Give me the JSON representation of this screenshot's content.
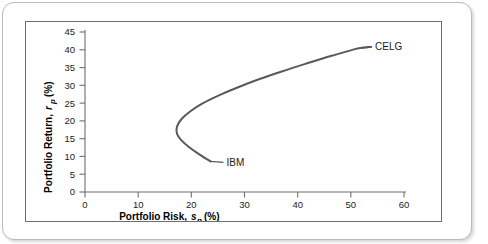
{
  "figure": {
    "background_color": "#ffffff",
    "border_color": "#b9babc",
    "plot_frame_color": "#6d6e70"
  },
  "chart_data": {
    "type": "line",
    "title": "",
    "subtitle": "",
    "xlabel": "Portfolio Risk, s_p (%)",
    "ylabel": "Portfolio Return, r_p (%)",
    "xlabel_parts": {
      "main": "Portfolio Risk,",
      "italic_symbol": "s",
      "subscript": "p",
      "unit": "(%)"
    },
    "ylabel_parts": {
      "main": "Portfolio Return,",
      "italic_symbol": "r",
      "subscript": "p",
      "unit": "(%)"
    },
    "xlim": [
      0,
      60
    ],
    "ylim": [
      0,
      45
    ],
    "xticks": [
      0,
      10,
      20,
      30,
      40,
      50,
      60
    ],
    "yticks": [
      0,
      5,
      10,
      15,
      20,
      25,
      30,
      35,
      40,
      45
    ],
    "grid": false,
    "legend": "none",
    "line_color": "#58595b",
    "series": [
      {
        "name": "efficient-frontier",
        "description": "Two-asset portfolio opportunity set between IBM and CELG",
        "points": [
          {
            "x": 23.6,
            "y": 8.6
          },
          {
            "x": 21.5,
            "y": 10.6
          },
          {
            "x": 19.6,
            "y": 12.6
          },
          {
            "x": 18.1,
            "y": 14.6
          },
          {
            "x": 17.3,
            "y": 16.4
          },
          {
            "x": 17.3,
            "y": 18.4
          },
          {
            "x": 18.2,
            "y": 20.6
          },
          {
            "x": 19.9,
            "y": 22.8
          },
          {
            "x": 22.2,
            "y": 25.0
          },
          {
            "x": 25.2,
            "y": 27.2
          },
          {
            "x": 28.7,
            "y": 29.4
          },
          {
            "x": 32.7,
            "y": 31.7
          },
          {
            "x": 37.0,
            "y": 33.9
          },
          {
            "x": 41.6,
            "y": 36.1
          },
          {
            "x": 46.4,
            "y": 38.3
          },
          {
            "x": 51.4,
            "y": 40.4
          },
          {
            "x": 53.8,
            "y": 40.8
          }
        ]
      }
    ],
    "annotations": [
      {
        "label": "IBM",
        "x": 23.6,
        "y": 8.6,
        "label_position": "right"
      },
      {
        "label": "CELG",
        "x": 53.8,
        "y": 40.8,
        "label_position": "right"
      }
    ]
  }
}
